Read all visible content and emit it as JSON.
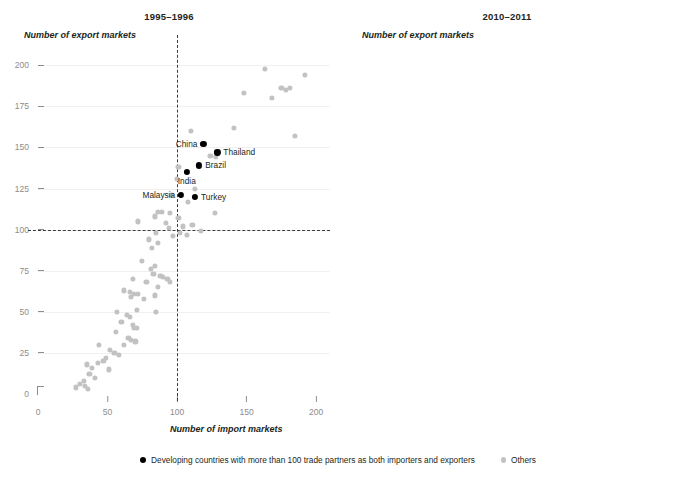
{
  "figure": {
    "legend": [
      {
        "key": "highlighted",
        "marker": "highlighted-dot",
        "label": "Developing countries with more than 100 trade partners as both importers and exporters"
      },
      {
        "key": "others",
        "marker": "other-dot",
        "label": "Others"
      }
    ],
    "colors": {
      "highlighted": "#000000",
      "others": "#c3c2c1",
      "reference_line": "#3b3b3b",
      "tick_label": "#8d8b8c",
      "text": "#231f20"
    }
  },
  "chart_data": [
    {
      "type": "scatter",
      "title": "1995–1996",
      "xlabel": "Number of import markets",
      "ylabel": "Number of export markets",
      "xlim": [
        0,
        210
      ],
      "ylim": [
        0,
        205
      ],
      "xticks": [
        0,
        50,
        100,
        150,
        200
      ],
      "yticks": [
        0,
        25,
        50,
        75,
        100,
        125,
        150,
        175,
        200
      ],
      "grid": false,
      "reference_lines": {
        "x": 100,
        "y": 100
      },
      "legend_position": "bottom-center",
      "series": [
        {
          "name": "Developing countries with more than 100 trade partners as both importers and exporters",
          "color": "#000000",
          "points": [
            {
              "label": "China",
              "x": 119,
              "y": 152,
              "label_side": "left"
            },
            {
              "label": "Thailand",
              "x": 129,
              "y": 147,
              "label_side": "right"
            },
            {
              "label": "Brazil",
              "x": 116,
              "y": 139,
              "label_side": "right"
            },
            {
              "label": "India",
              "x": 107,
              "y": 135,
              "label_side": "below"
            },
            {
              "label": "Malaysia",
              "x": 103,
              "y": 121,
              "label_side": "left"
            },
            {
              "label": "Turkey",
              "x": 113,
              "y": 120,
              "label_side": "right"
            }
          ]
        },
        {
          "name": "Others",
          "color": "#c3c2c1",
          "points": [
            {
              "x": 163,
              "y": 198
            },
            {
              "x": 192,
              "y": 194
            },
            {
              "x": 175,
              "y": 186
            },
            {
              "x": 181,
              "y": 186
            },
            {
              "x": 178,
              "y": 185
            },
            {
              "x": 148,
              "y": 183
            },
            {
              "x": 168,
              "y": 180
            },
            {
              "x": 185,
              "y": 157
            },
            {
              "x": 141,
              "y": 162
            },
            {
              "x": 110,
              "y": 160
            },
            {
              "x": 101,
              "y": 138
            },
            {
              "x": 124,
              "y": 145
            },
            {
              "x": 128,
              "y": 144
            },
            {
              "x": 100,
              "y": 131
            },
            {
              "x": 113,
              "y": 125
            },
            {
              "x": 96,
              "y": 121
            },
            {
              "x": 108,
              "y": 117
            },
            {
              "x": 86,
              "y": 111
            },
            {
              "x": 89,
              "y": 111
            },
            {
              "x": 95,
              "y": 110
            },
            {
              "x": 127,
              "y": 110
            },
            {
              "x": 84,
              "y": 108
            },
            {
              "x": 101,
              "y": 107
            },
            {
              "x": 72,
              "y": 105
            },
            {
              "x": 92,
              "y": 104
            },
            {
              "x": 111,
              "y": 103
            },
            {
              "x": 104,
              "y": 102
            },
            {
              "x": 94,
              "y": 101
            },
            {
              "x": 117,
              "y": 99
            },
            {
              "x": 85,
              "y": 98
            },
            {
              "x": 102,
              "y": 98
            },
            {
              "x": 107,
              "y": 97
            },
            {
              "x": 97,
              "y": 96
            },
            {
              "x": 80,
              "y": 94
            },
            {
              "x": 86,
              "y": 92
            },
            {
              "x": 82,
              "y": 89
            },
            {
              "x": 75,
              "y": 81
            },
            {
              "x": 84,
              "y": 78
            },
            {
              "x": 81,
              "y": 76
            },
            {
              "x": 83,
              "y": 73
            },
            {
              "x": 88,
              "y": 72
            },
            {
              "x": 90,
              "y": 71
            },
            {
              "x": 93,
              "y": 70
            },
            {
              "x": 95,
              "y": 68
            },
            {
              "x": 68,
              "y": 70
            },
            {
              "x": 78,
              "y": 68
            },
            {
              "x": 86,
              "y": 65
            },
            {
              "x": 62,
              "y": 63
            },
            {
              "x": 66,
              "y": 62
            },
            {
              "x": 69,
              "y": 61
            },
            {
              "x": 72,
              "y": 61
            },
            {
              "x": 67,
              "y": 59
            },
            {
              "x": 76,
              "y": 58
            },
            {
              "x": 84,
              "y": 60
            },
            {
              "x": 71,
              "y": 51
            },
            {
              "x": 85,
              "y": 50
            },
            {
              "x": 57,
              "y": 50
            },
            {
              "x": 64,
              "y": 48
            },
            {
              "x": 66,
              "y": 47
            },
            {
              "x": 60,
              "y": 44
            },
            {
              "x": 68,
              "y": 42
            },
            {
              "x": 69,
              "y": 40
            },
            {
              "x": 71,
              "y": 40
            },
            {
              "x": 56,
              "y": 38
            },
            {
              "x": 65,
              "y": 34
            },
            {
              "x": 67,
              "y": 33
            },
            {
              "x": 70,
              "y": 32
            },
            {
              "x": 62,
              "y": 30
            },
            {
              "x": 44,
              "y": 30
            },
            {
              "x": 52,
              "y": 27
            },
            {
              "x": 55,
              "y": 25
            },
            {
              "x": 58,
              "y": 24
            },
            {
              "x": 49,
              "y": 22
            },
            {
              "x": 47,
              "y": 20
            },
            {
              "x": 43,
              "y": 19
            },
            {
              "x": 35,
              "y": 18
            },
            {
              "x": 39,
              "y": 16
            },
            {
              "x": 51,
              "y": 15
            },
            {
              "x": 37,
              "y": 12
            },
            {
              "x": 41,
              "y": 10
            },
            {
              "x": 33,
              "y": 8
            },
            {
              "x": 34,
              "y": 5
            },
            {
              "x": 36,
              "y": 3
            },
            {
              "x": 30,
              "y": 6
            },
            {
              "x": 27,
              "y": 4
            }
          ]
        }
      ]
    },
    {
      "type": "scatter",
      "title": "2010–2011",
      "xlabel": "Number of import markets",
      "ylabel": "Number of export markets",
      "xlim": [
        0,
        210
      ],
      "ylim": [
        0,
        205
      ],
      "xticks": [
        0,
        50,
        100,
        150,
        200
      ],
      "yticks": [
        0,
        25,
        50,
        75,
        100,
        125,
        150,
        175,
        200
      ],
      "grid": false,
      "reference_lines": {
        "x": 100,
        "y": 100
      },
      "legend_position": "bottom-center",
      "series": [
        {
          "name": "Developing countries with more than 100 trade partners as both importers and exporters",
          "color": "#000000",
          "points": [
            {
              "label": "China",
              "x": 168,
              "y": 200,
              "label_side": "left"
            },
            {
              "label": "Thailand",
              "x": 144,
              "y": 186,
              "label_side": "leader-upleft"
            },
            {
              "label": "Turkey",
              "x": 139,
              "y": 177,
              "label_side": "left"
            },
            {
              "label": "India",
              "x": 152,
              "y": 175,
              "label_side": "right"
            },
            {
              "label": "Brazil",
              "x": 127,
              "y": 174,
              "label_side": "left"
            },
            {
              "label": "Malaysia",
              "x": 141,
              "y": 170,
              "label_side": "right"
            },
            {
              "label": "Indonesia",
              "x": 146,
              "y": 164,
              "label_side": "right"
            },
            {
              "label": "Viet Nam",
              "x": 143,
              "y": 149,
              "label_side": "right"
            },
            {
              "label": "South Africa",
              "x": 130,
              "y": 146,
              "label_side": "left"
            },
            {
              "label": "Ukraine",
              "x": 122,
              "y": 134,
              "label_side": "right"
            },
            {
              "label": "Egypt",
              "x": 126,
              "y": 129,
              "label_side": "right"
            },
            {
              "label": "Pakistan",
              "x": 121,
              "y": 124,
              "label_side": "right"
            },
            {
              "label": "United Arab Emirates",
              "x": 140,
              "y": 116,
              "label_side": "right"
            },
            {
              "label": "Mexico",
              "x": 128,
              "y": 115,
              "label_side": "below"
            },
            {
              "label": "Morocco",
              "x": 114,
              "y": 112,
              "label_side": "below"
            }
          ]
        },
        {
          "name": "Others",
          "color": "#c3c2c1",
          "points": [
            {
              "x": 186,
              "y": 200
            },
            {
              "x": 197,
              "y": 200
            },
            {
              "x": 162,
              "y": 190
            },
            {
              "x": 176,
              "y": 190
            },
            {
              "x": 156,
              "y": 187
            },
            {
              "x": 149,
              "y": 182
            },
            {
              "x": 138,
              "y": 179
            },
            {
              "x": 145,
              "y": 174
            },
            {
              "x": 131,
              "y": 174
            },
            {
              "x": 108,
              "y": 157
            },
            {
              "x": 101,
              "y": 156
            },
            {
              "x": 111,
              "y": 145
            },
            {
              "x": 96,
              "y": 142
            },
            {
              "x": 99,
              "y": 141
            },
            {
              "x": 92,
              "y": 137
            },
            {
              "x": 89,
              "y": 131
            },
            {
              "x": 116,
              "y": 122
            },
            {
              "x": 84,
              "y": 125
            },
            {
              "x": 81,
              "y": 123
            },
            {
              "x": 105,
              "y": 115
            },
            {
              "x": 103,
              "y": 114
            },
            {
              "x": 104,
              "y": 112
            },
            {
              "x": 78,
              "y": 113
            },
            {
              "x": 75,
              "y": 112
            },
            {
              "x": 79,
              "y": 110
            },
            {
              "x": 101,
              "y": 108
            },
            {
              "x": 76,
              "y": 105
            },
            {
              "x": 80,
              "y": 104
            },
            {
              "x": 95,
              "y": 99
            },
            {
              "x": 88,
              "y": 98
            },
            {
              "x": 91,
              "y": 97
            },
            {
              "x": 98,
              "y": 95
            },
            {
              "x": 84,
              "y": 93
            },
            {
              "x": 87,
              "y": 92
            },
            {
              "x": 97,
              "y": 90
            },
            {
              "x": 92,
              "y": 88
            },
            {
              "x": 73,
              "y": 89
            },
            {
              "x": 94,
              "y": 86
            },
            {
              "x": 89,
              "y": 85
            },
            {
              "x": 102,
              "y": 84
            },
            {
              "x": 86,
              "y": 82
            },
            {
              "x": 70,
              "y": 81
            },
            {
              "x": 82,
              "y": 79
            },
            {
              "x": 86,
              "y": 78
            },
            {
              "x": 98,
              "y": 76
            },
            {
              "x": 68,
              "y": 74
            },
            {
              "x": 83,
              "y": 72
            },
            {
              "x": 79,
              "y": 71
            },
            {
              "x": 87,
              "y": 69
            },
            {
              "x": 90,
              "y": 68
            },
            {
              "x": 85,
              "y": 67
            },
            {
              "x": 88,
              "y": 66
            },
            {
              "x": 94,
              "y": 65
            },
            {
              "x": 72,
              "y": 64
            },
            {
              "x": 78,
              "y": 63
            },
            {
              "x": 81,
              "y": 62
            },
            {
              "x": 84,
              "y": 60
            },
            {
              "x": 91,
              "y": 59
            },
            {
              "x": 132,
              "y": 72
            },
            {
              "x": 62,
              "y": 57
            },
            {
              "x": 74,
              "y": 56
            },
            {
              "x": 77,
              "y": 54
            },
            {
              "x": 86,
              "y": 53
            },
            {
              "x": 52,
              "y": 51
            },
            {
              "x": 58,
              "y": 49
            },
            {
              "x": 67,
              "y": 48
            },
            {
              "x": 70,
              "y": 47
            },
            {
              "x": 73,
              "y": 46
            },
            {
              "x": 63,
              "y": 45
            },
            {
              "x": 65,
              "y": 44
            },
            {
              "x": 68,
              "y": 43
            },
            {
              "x": 71,
              "y": 42
            },
            {
              "x": 60,
              "y": 41
            },
            {
              "x": 76,
              "y": 40
            },
            {
              "x": 79,
              "y": 38
            },
            {
              "x": 46,
              "y": 36
            },
            {
              "x": 55,
              "y": 35
            },
            {
              "x": 58,
              "y": 34
            },
            {
              "x": 62,
              "y": 33
            },
            {
              "x": 66,
              "y": 32
            },
            {
              "x": 69,
              "y": 31
            },
            {
              "x": 72,
              "y": 30
            },
            {
              "x": 50,
              "y": 28
            },
            {
              "x": 53,
              "y": 27
            },
            {
              "x": 57,
              "y": 26
            },
            {
              "x": 61,
              "y": 25
            },
            {
              "x": 64,
              "y": 24
            },
            {
              "x": 51,
              "y": 22
            },
            {
              "x": 54,
              "y": 21
            },
            {
              "x": 47,
              "y": 19
            },
            {
              "x": 58,
              "y": 18
            },
            {
              "x": 42,
              "y": 14
            },
            {
              "x": 49,
              "y": 13
            },
            {
              "x": 56,
              "y": 12
            },
            {
              "x": 40,
              "y": 9
            },
            {
              "x": 44,
              "y": 6
            },
            {
              "x": 91,
              "y": 2
            }
          ]
        }
      ]
    }
  ]
}
